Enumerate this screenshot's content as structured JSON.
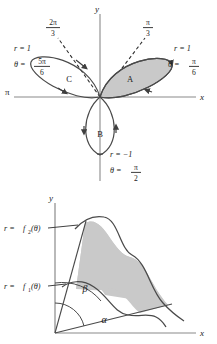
{
  "figure_rose": {
    "name": "three-petal-rose-polar-plot",
    "axis_labels": {
      "y": "y",
      "x": "x",
      "left_end": "π"
    },
    "dashed_ray_labels": [
      {
        "id": "two-pi-over-three",
        "numerator": "2π",
        "denominator": "3",
        "angle_deg": 120
      },
      {
        "id": "pi-over-three",
        "numerator": "π",
        "denominator": "3",
        "angle_deg": 60
      }
    ],
    "petals": [
      {
        "id": "A",
        "label": "A",
        "shaded": true,
        "angle_deg": 30
      },
      {
        "id": "B",
        "label": "B",
        "shaded": false,
        "angle_deg": 270
      },
      {
        "id": "C",
        "label": "C",
        "shaded": false,
        "angle_deg": 150
      }
    ],
    "annotations": [
      {
        "id": "left-annotation",
        "r_label": "r = 1",
        "r_value": "1",
        "theta_prefix": "θ =",
        "theta_numerator": "5π",
        "theta_denominator": "6"
      },
      {
        "id": "right-annotation",
        "r_label": "r = 1",
        "r_value": "1",
        "theta_prefix": "θ =",
        "theta_numerator": "π",
        "theta_denominator": "6"
      },
      {
        "id": "bottom-annotation",
        "r_label": "r = −1",
        "r_value": "−1",
        "theta_prefix": "θ =",
        "theta_numerator": "π",
        "theta_denominator": "2"
      }
    ]
  },
  "figure_region": {
    "name": "polar-region-between-two-curves",
    "axis_labels": {
      "y": "y",
      "x": "x"
    },
    "curve_labels": [
      {
        "id": "outer-curve",
        "prefix": "r =",
        "fn": "f",
        "sub": "2",
        "arg": "(θ)"
      },
      {
        "id": "inner-curve",
        "prefix": "r =",
        "fn": "f",
        "sub": "1",
        "arg": "(θ)"
      }
    ],
    "angle_labels": [
      {
        "id": "beta-angle",
        "text": "β"
      },
      {
        "id": "alpha-angle",
        "text": "α"
      }
    ]
  },
  "colors": {
    "ink": "#1a1a1a",
    "curve": "#4a4a4a",
    "axis": "#707070",
    "shade": "#c9c9c9",
    "shade_stroke": "#555555",
    "background": "#ffffff"
  }
}
